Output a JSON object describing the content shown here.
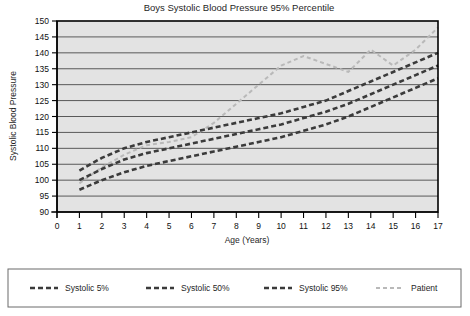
{
  "chart_data": {
    "type": "line",
    "title": "Boys Systolic Blood Pressure 95% Percentile",
    "xlabel": "Age (Years)",
    "ylabel": "Systolic Blood Pressure",
    "xlim": [
      0,
      17
    ],
    "ylim": [
      90,
      150
    ],
    "xticks": [
      0,
      1,
      2,
      3,
      4,
      5,
      6,
      7,
      8,
      9,
      10,
      11,
      12,
      13,
      14,
      15,
      16,
      17
    ],
    "yticks": [
      90,
      95,
      100,
      105,
      110,
      115,
      120,
      125,
      130,
      135,
      140,
      145,
      150
    ],
    "grid": true,
    "legend_position": "bottom",
    "x": [
      1,
      2,
      3,
      4,
      5,
      6,
      7,
      8,
      9,
      10,
      11,
      12,
      13,
      14,
      15,
      16,
      17
    ],
    "series": [
      {
        "name": "Systolic 95%",
        "color": "#3b3b3b",
        "dash": "5,3",
        "width": 2.6,
        "values": [
          103,
          107,
          110,
          112,
          113.5,
          115,
          116.5,
          118,
          119.5,
          121,
          123,
          125,
          128,
          131,
          134,
          137,
          140
        ]
      },
      {
        "name": "Systolic 50%",
        "color": "#3b3b3b",
        "dash": "5,3",
        "width": 2.6,
        "values": [
          100,
          103.5,
          106.5,
          108.5,
          110,
          111.5,
          113,
          114.5,
          116,
          117.5,
          119.5,
          121.5,
          124,
          127,
          130,
          133,
          136
        ]
      },
      {
        "name": "Systolic 5%",
        "color": "#3b3b3b",
        "dash": "5,3",
        "width": 2.6,
        "values": [
          97,
          100,
          102.5,
          104.5,
          106,
          107.5,
          109,
          110.5,
          112,
          113.5,
          115.5,
          117.5,
          120,
          123,
          126,
          129,
          132
        ]
      },
      {
        "name": "Patient",
        "color": "#b9b9b9",
        "dash": "4,3",
        "width": 2.0,
        "values": [
          99,
          104,
          108,
          111,
          112,
          113.5,
          118,
          124,
          130,
          136,
          139,
          136.5,
          134,
          141,
          136,
          141,
          148
        ]
      }
    ],
    "legend": [
      {
        "label": "Systolic 5%",
        "color": "#3b3b3b",
        "dash": "5,3",
        "width": 2.6
      },
      {
        "label": "Systolic 50%",
        "color": "#3b3b3b",
        "dash": "5,3",
        "width": 2.6
      },
      {
        "label": "Systolic 95%",
        "color": "#3b3b3b",
        "dash": "5,3",
        "width": 2.6
      },
      {
        "label": "Patient",
        "color": "#b9b9b9",
        "dash": "4,3",
        "width": 2.0
      }
    ],
    "plot_background": "#e3e3e3",
    "page_background": "#ffffff"
  }
}
